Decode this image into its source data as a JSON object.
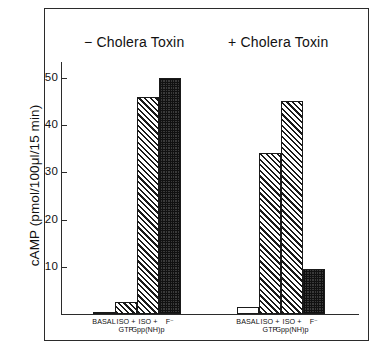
{
  "chart_data": {
    "type": "bar",
    "title": "",
    "xlabel": "",
    "ylabel": "cAMP (pmol/100μl/15 min)",
    "ylim": [
      0,
      55
    ],
    "yticks": [
      10,
      20,
      30,
      40,
      50
    ],
    "ytick_labels": [
      "10",
      "20",
      "30",
      "40",
      "50"
    ],
    "grid": false,
    "legend": "none",
    "categories": [
      "BASAL",
      "ISO + GTP",
      "ISO + Gpp(NH)p",
      "F⁻"
    ],
    "groups": [
      {
        "name": "− Cholera Toxin",
        "values": [
          0.5,
          2.5,
          46.0,
          50.0
        ],
        "fills": [
          "plain",
          "hatch",
          "hatch",
          "dots"
        ]
      },
      {
        "name": "+ Cholera Toxin",
        "values": [
          1.5,
          34.0,
          45.0,
          9.5
        ],
        "fills": [
          "plain",
          "hatch",
          "hatch",
          "dots"
        ]
      }
    ],
    "category_label_lines": [
      {
        "line1": "BASAL",
        "line2": ""
      },
      {
        "line1": "ISO +",
        "line2": "GTP"
      },
      {
        "line1": "ISO +",
        "line2": "Gpp(NH)p"
      },
      {
        "line1": "F⁻",
        "line2": ""
      }
    ],
    "colors": {
      "axis": "#2b2b2b",
      "bar_outline": "#1a1a1a",
      "hatch": "#1a1a1a",
      "dots": "#3a3a3a",
      "background": "#ffffff",
      "text": "#111111"
    }
  }
}
